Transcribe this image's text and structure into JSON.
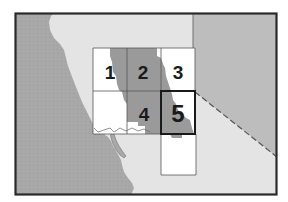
{
  "map": {
    "type": "index-map",
    "description": "Index map of numbered map tiles over a coastline",
    "colors": {
      "ocean": "#a6a6a6",
      "land": "#e4e4e4",
      "neighbor_region": "#bdbdbd",
      "shaded_area": "#9a9a9a",
      "tile_fill": "#ffffff",
      "tile_border": "#555555",
      "frame": "#2a2a2a",
      "highlight_border": "#1a1a1a",
      "label": "#1a1a1a"
    },
    "tiles": [
      {
        "id": "1",
        "label": "1",
        "highlighted": false
      },
      {
        "id": "2",
        "label": "2",
        "highlighted": false
      },
      {
        "id": "3",
        "label": "3",
        "highlighted": false
      },
      {
        "id": "4",
        "label": "4",
        "highlighted": false
      },
      {
        "id": "5",
        "label": "5",
        "highlighted": true
      }
    ],
    "unlabeled_tiles": 2,
    "boundaries": {
      "state_line_solid": true,
      "state_line_dashed": true
    }
  }
}
